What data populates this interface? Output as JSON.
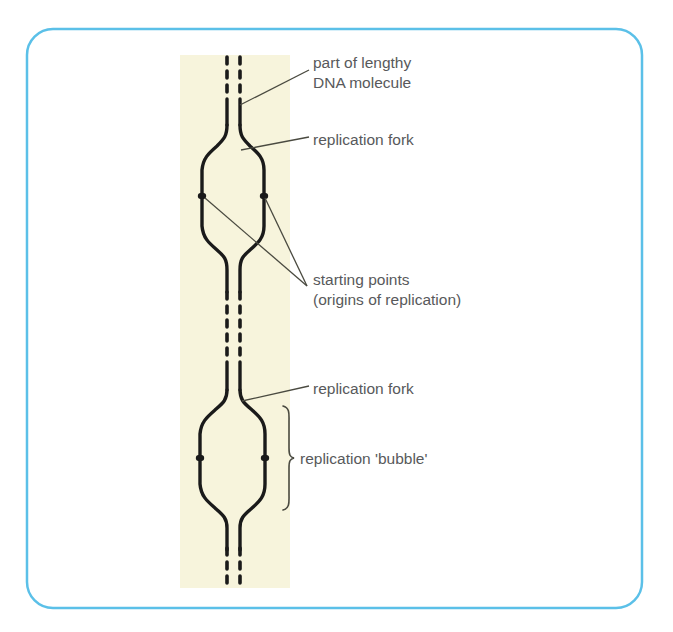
{
  "figure": {
    "frame": {
      "border_color": "#5bc0e8",
      "border_width": 2.5,
      "corner_radius": 26,
      "x": 27,
      "y": 29,
      "width": 615,
      "height": 579
    },
    "band": {
      "name": "dna-highlight-band",
      "color": "#f7f4dc",
      "x": 180,
      "y": 55,
      "width": 110,
      "height": 533
    },
    "strand_color": "#1a1a1a",
    "leader_color": "#4a4a40",
    "text_color": "#58595b"
  },
  "labels": [
    {
      "id": "part-of-lengthy-dna-molecule",
      "lines": [
        "part of lengthy",
        "DNA molecule"
      ],
      "x": 313,
      "y": 53
    },
    {
      "id": "replication-fork-upper",
      "lines": [
        "replication fork"
      ],
      "x": 313,
      "y": 130
    },
    {
      "id": "starting-points-origins-of-replication",
      "lines": [
        "starting points",
        "(origins of replication)"
      ],
      "x": 313,
      "y": 270
    },
    {
      "id": "replication-fork-lower",
      "lines": [
        "replication fork"
      ],
      "x": 313,
      "y": 379
    },
    {
      "id": "replication-bubble",
      "lines": [
        "replication 'bubble'"
      ],
      "x": 300,
      "y": 449
    }
  ],
  "diagram_elements": {
    "strands": {
      "left_x": 227,
      "right_x": 240,
      "dashed_segments": [
        {
          "name": "top-dashed-dna",
          "y_start": 57,
          "y_end": 97
        },
        {
          "name": "middle-dashed-dna",
          "y_start": 292,
          "y_end": 360
        },
        {
          "name": "bottom-dashed-dna",
          "y_start": 548,
          "y_end": 588
        }
      ]
    },
    "bubbles": [
      {
        "name": "upper-replication-bubble",
        "left_x": 202,
        "right_x": 264,
        "top_y": 140,
        "bottom_y": 250,
        "origin_dot_y": 196
      },
      {
        "name": "lower-replication-bubble",
        "left_x": 200,
        "right_x": 265,
        "top_y": 404,
        "bottom_y": 512,
        "origin_dot_y": 458
      }
    ],
    "origin_dots": [
      {
        "x": 203,
        "y": 196
      },
      {
        "x": 263,
        "y": 196
      },
      {
        "x": 201,
        "y": 458
      },
      {
        "x": 264,
        "y": 458
      }
    ],
    "leader_lines": [
      {
        "name": "leader-dna-molecule",
        "x1": 240,
        "y1": 104,
        "x2": 308,
        "y2": 70
      },
      {
        "name": "leader-fork-upper",
        "x1": 243,
        "y1": 150,
        "x2": 308,
        "y2": 137
      },
      {
        "name": "leader-origin-upper-left",
        "x1": 205,
        "y1": 197,
        "x2": 306,
        "y2": 286
      },
      {
        "name": "leader-origin-upper-right",
        "x1": 264,
        "y1": 197,
        "x2": 306,
        "y2": 286
      },
      {
        "name": "leader-fork-lower",
        "x1": 243,
        "y1": 402,
        "x2": 308,
        "y2": 386
      }
    ],
    "brace": {
      "name": "replication-bubble-brace",
      "x": 288,
      "y_top": 406,
      "y_bottom": 510,
      "y_mid": 458
    }
  }
}
